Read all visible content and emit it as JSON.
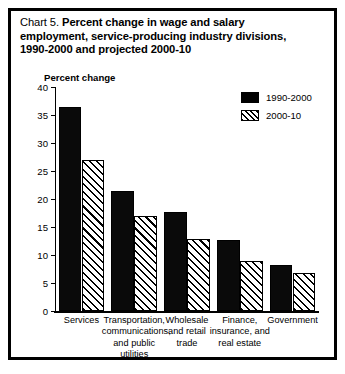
{
  "figure": {
    "chart_number_label": "Chart 5.",
    "title_line1": "Percent change in wage and salary",
    "title_line2": "employment, service-producing industry divisions,",
    "title_line3": "1990-2000 and projected 2000-10",
    "y_axis_caption": "Percent change",
    "frame_color": "#000000",
    "background_color": "#ffffff"
  },
  "legend": {
    "position": "top-right",
    "items": [
      {
        "label": "1990-2000",
        "swatch": "solid-black",
        "color": "#000000"
      },
      {
        "label": "2000-10",
        "swatch": "diagonal-hatch",
        "color": "#000000"
      }
    ]
  },
  "chart_data": {
    "type": "bar",
    "title": "Chart 5. Percent change in wage and salary employment, service-producing industry divisions, 1990-2000 and projected 2000-10",
    "xlabel": "",
    "ylabel": "Percent change",
    "ylim": [
      0,
      40
    ],
    "yticks": [
      0,
      5,
      10,
      15,
      20,
      25,
      30,
      35,
      40
    ],
    "ytick_labels": [
      "0",
      "5",
      "10",
      "15",
      "20",
      "25",
      "30",
      "35",
      "40"
    ],
    "grid": false,
    "legend_position": "upper right",
    "categories": [
      "Services",
      "Transportation, communications, and public utilities",
      "Wholesale and retail trade",
      "Finance, insurance, and real estate",
      "Government"
    ],
    "category_label_lines": [
      [
        "Services"
      ],
      [
        "Transportation,",
        "communications,",
        "and public utilities"
      ],
      [
        "Wholesale",
        "and retail",
        "trade"
      ],
      [
        "Finance,",
        "insurance, and",
        "real estate"
      ],
      [
        "Government"
      ]
    ],
    "series": [
      {
        "name": "1990-2000",
        "values": [
          36.5,
          21.5,
          17.7,
          12.7,
          8.2
        ]
      },
      {
        "name": "2000-10",
        "values": [
          27.0,
          17.0,
          12.8,
          9.0,
          6.8
        ]
      }
    ]
  }
}
